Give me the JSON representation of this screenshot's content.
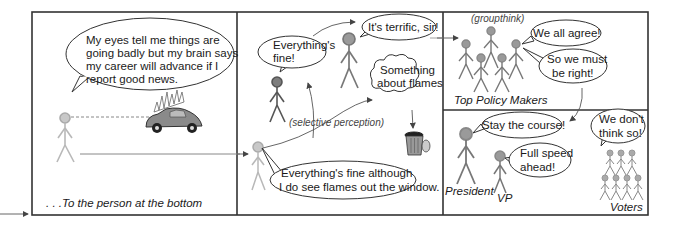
{
  "panels": {
    "panel1": {
      "speech": [
        "My eyes tell me things are",
        "going badly but my brain says",
        "my career will advance if I",
        "report good news."
      ],
      "caption": ". . .To the person at the bottom"
    },
    "panel2": {
      "bubble_fine": [
        "Everything's",
        "fine!"
      ],
      "bubble_terrific": "It's terrific, sir!",
      "thought_flames": [
        "Something",
        "about flames"
      ],
      "annotation": "(selective perception)",
      "bottom_speech": [
        "Everything's fine although",
        "I do see flames out the window."
      ]
    },
    "panel3": {
      "annotation": "(groupthink)",
      "bubble_agree": "We all agree!",
      "bubble_right": [
        "So we must",
        "be right!"
      ],
      "caption": "Top Policy Makers"
    },
    "panel4": {
      "bubble_course": "Stay the course!",
      "bubble_speed": [
        "Full speed",
        "ahead!"
      ],
      "bubble_voters": [
        "We don't",
        "think so!"
      ],
      "label_president": "President",
      "label_vp": "VP",
      "label_voters": "Voters"
    }
  },
  "icons": {
    "car": "burning-car-icon",
    "trash": "trash-can-icon"
  },
  "colors": {
    "head_light": "#c8c8c8",
    "head_mid": "#9a9a9a",
    "head_dark": "#7d7d7d",
    "frame": "#333333"
  }
}
